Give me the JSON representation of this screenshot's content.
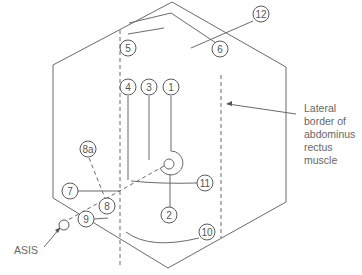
{
  "diagram": {
    "markers": [
      {
        "id": "5",
        "label": "5"
      },
      {
        "id": "6",
        "label": "6"
      },
      {
        "id": "12",
        "label": "12"
      },
      {
        "id": "4",
        "label": "4"
      },
      {
        "id": "3",
        "label": "3"
      },
      {
        "id": "1",
        "label": "1"
      },
      {
        "id": "8a",
        "label": "8a"
      },
      {
        "id": "7",
        "label": "7"
      },
      {
        "id": "8",
        "label": "8"
      },
      {
        "id": "9",
        "label": "9"
      },
      {
        "id": "11",
        "label": "11"
      },
      {
        "id": "2",
        "label": "2"
      },
      {
        "id": "10",
        "label": "10"
      }
    ],
    "annotations": {
      "asis": "ASIS",
      "lateral_border": [
        "Lateral",
        "border of",
        "abdominus",
        "rectus",
        "muscle"
      ]
    },
    "colors": {
      "line": "#6a6a6a",
      "text": "#555555"
    }
  }
}
